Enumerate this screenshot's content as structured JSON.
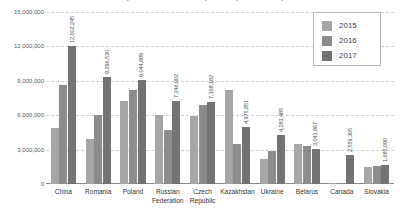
{
  "chart_data": {
    "type": "bar",
    "title": "Import of wood and wood products (cubic meters)",
    "xlabel": "",
    "ylabel": "",
    "ylim": [
      0,
      15000000
    ],
    "yticks": [
      0,
      3000000,
      6000000,
      9000000,
      12000000,
      15000000
    ],
    "ytick_labels": [
      "0",
      "3,000,000",
      "6,000,000",
      "9,000,000",
      "12,000,000",
      "15,000,000"
    ],
    "grid": true,
    "legend_position": "top-right",
    "categories": [
      "China",
      "Romania",
      "Poland",
      "Russian\nFederation",
      "Czech\nRepublic",
      "Kazakhstan",
      "Ukraine",
      "Belarus",
      "Canada",
      "Slovakia"
    ],
    "series": [
      {
        "name": "2015",
        "color": "#a6a6a6",
        "values": [
          4900000,
          3900000,
          7250000,
          6000000,
          5900000,
          8200000,
          2200000,
          3450000,
          60000,
          1500000
        ]
      },
      {
        "name": "2016",
        "color": "#8c8c8c",
        "values": [
          8600000,
          6000000,
          8200000,
          4700000,
          6850000,
          3500000,
          2900000,
          3300000,
          130000,
          1560000
        ]
      },
      {
        "name": "2017",
        "color": "#737373",
        "values": [
          12002245,
          9296530,
          9044889,
          7246002,
          7168182,
          4975851,
          4283485,
          3041867,
          2559305,
          1685090
        ]
      }
    ],
    "data_labels": [
      "12,002,245",
      "9,296,530",
      "9,044,889",
      "7,246,002",
      "7,168,182",
      "4,975,851",
      "4,283,485",
      "3,041,867",
      "2,559,305",
      "1,685,090"
    ],
    "data_labels_series": "2017"
  },
  "legend": {
    "items": [
      {
        "label": "2015"
      },
      {
        "label": "2016"
      },
      {
        "label": "2017"
      }
    ]
  }
}
